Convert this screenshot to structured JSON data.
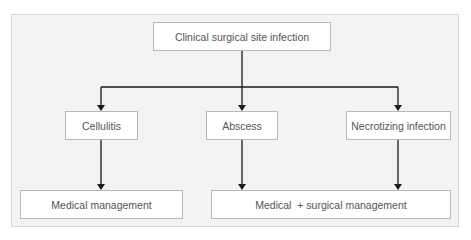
{
  "diagram": {
    "root": {
      "label": "Clinical surgical site infection"
    },
    "types": [
      {
        "label": "Cellulitis"
      },
      {
        "label": "Abscess"
      },
      {
        "label": "Necrotizing infection"
      }
    ],
    "management": [
      {
        "label": "Medical management"
      },
      {
        "label": "Medical  + surgical management"
      }
    ],
    "edges": [
      {
        "from": "Clinical surgical site infection",
        "to": "Cellulitis"
      },
      {
        "from": "Clinical surgical site infection",
        "to": "Abscess"
      },
      {
        "from": "Clinical surgical site infection",
        "to": "Necrotizing infection"
      },
      {
        "from": "Cellulitis",
        "to": "Medical management"
      },
      {
        "from": "Abscess",
        "to": "Medical  + surgical management"
      },
      {
        "from": "Necrotizing infection",
        "to": "Medical  + surgical management"
      }
    ],
    "colors": {
      "panel": "#f3f3f3",
      "box": "#ffffff",
      "border": "#b9b9b9",
      "line": "#1a1a1a",
      "text": "#555555"
    }
  }
}
